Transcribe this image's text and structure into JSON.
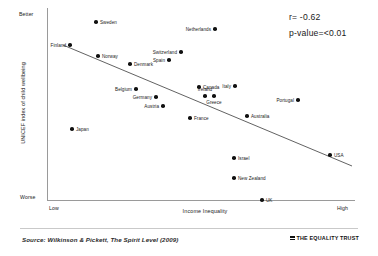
{
  "chart_data": {
    "type": "scatter",
    "title": "",
    "xlabel": "Income Inequality",
    "ylabel": "UNICEF index of child wellbeing",
    "x_axis": {
      "low_label": "Low",
      "high_label": "High",
      "grid": false
    },
    "y_axis": {
      "top_label": "Better",
      "bottom_label": "Worse",
      "grid": false
    },
    "annotations": {
      "correlation": "r= -0.62",
      "p_value": "p-value=<0.01"
    },
    "trendline": {
      "type": "linear-fit",
      "x1_px": 63,
      "y1_px": 45,
      "x2_px": 352,
      "y2_px": 166
    },
    "points": [
      {
        "name": "Sweden",
        "x": 0.205,
        "y": 0.93,
        "px": 96,
        "py": 22,
        "label_pos": "right"
      },
      {
        "name": "Netherlands",
        "x": 0.545,
        "y": 0.895,
        "px": 215,
        "py": 29,
        "label_pos": "left"
      },
      {
        "name": "Finland",
        "x": 0.075,
        "y": 0.82,
        "px": 70,
        "py": 45,
        "label_pos": "left"
      },
      {
        "name": "Norway",
        "x": 0.155,
        "y": 0.755,
        "px": 98,
        "py": 56,
        "label_pos": "right"
      },
      {
        "name": "Switzerland",
        "x": 0.435,
        "y": 0.775,
        "px": 181,
        "py": 52,
        "label_pos": "left"
      },
      {
        "name": "Denmark",
        "x": 0.245,
        "y": 0.705,
        "px": 130,
        "py": 64,
        "label_pos": "right"
      },
      {
        "name": "Spain",
        "x": 0.395,
        "y": 0.73,
        "px": 169,
        "py": 60,
        "label_pos": "left"
      },
      {
        "name": "Belgium",
        "x": 0.305,
        "y": 0.555,
        "px": 136,
        "py": 89,
        "label_pos": "left"
      },
      {
        "name": "Canada",
        "x": 0.565,
        "y": 0.565,
        "px": 199,
        "py": 87,
        "label_pos": "right"
      },
      {
        "name": "Italy",
        "x": 0.665,
        "y": 0.565,
        "px": 235,
        "py": 86,
        "label_pos": "left"
      },
      {
        "name": "Germany",
        "x": 0.385,
        "y": 0.505,
        "px": 156,
        "py": 97,
        "label_pos": "left"
      },
      {
        "name": "Ireland",
        "x": 0.585,
        "y": 0.505,
        "px": 205,
        "py": 96,
        "label_pos": "above"
      },
      {
        "name": "Greece",
        "x": 0.625,
        "y": 0.495,
        "px": 214,
        "py": 96,
        "label_pos": "below"
      },
      {
        "name": "Austria",
        "x": 0.405,
        "y": 0.445,
        "px": 163,
        "py": 106,
        "label_pos": "left"
      },
      {
        "name": "Portugal",
        "x": 0.845,
        "y": 0.475,
        "px": 298,
        "py": 100,
        "label_pos": "left"
      },
      {
        "name": "France",
        "x": 0.495,
        "y": 0.375,
        "px": 190,
        "py": 118,
        "label_pos": "right"
      },
      {
        "name": "Australia",
        "x": 0.695,
        "y": 0.385,
        "px": 247,
        "py": 116,
        "label_pos": "right"
      },
      {
        "name": "Japan",
        "x": 0.085,
        "y": 0.305,
        "px": 72,
        "py": 129,
        "label_pos": "right"
      },
      {
        "name": "USA",
        "x": 0.955,
        "y": 0.185,
        "px": 330,
        "py": 155,
        "label_pos": "right"
      },
      {
        "name": "Israel",
        "x": 0.675,
        "y": 0.175,
        "px": 234,
        "py": 158,
        "label_pos": "right"
      },
      {
        "name": "New Zealand",
        "x": 0.675,
        "y": 0.075,
        "px": 234,
        "py": 178,
        "label_pos": "right"
      },
      {
        "name": "UK",
        "x": 0.755,
        "y": 0.0,
        "px": 262,
        "py": 200,
        "label_pos": "right"
      }
    ]
  },
  "footer": {
    "source": "Source: Wilkinson & Pickett, The Spirit Level (2009)",
    "brand": "THE EQUALITY TRUST"
  }
}
